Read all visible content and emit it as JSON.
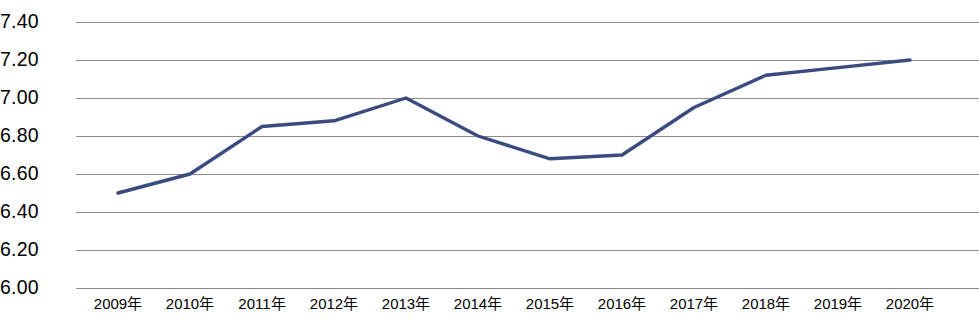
{
  "chart_data": {
    "type": "line",
    "title": "",
    "subtitle": "",
    "xlabel": "",
    "ylabel": "",
    "categories": [
      "2009年",
      "2010年",
      "2011年",
      "2012年",
      "2013年",
      "2014年",
      "2015年",
      "2016年",
      "2017年",
      "2018年",
      "2019年",
      "2020年"
    ],
    "series": [
      {
        "name": "",
        "values": [
          6.5,
          6.6,
          6.85,
          6.88,
          7.0,
          6.8,
          6.68,
          6.7,
          6.95,
          7.12,
          7.16,
          7.2
        ]
      }
    ],
    "ylim": [
      6.0,
      7.4
    ],
    "ytick_labels": [
      "7.40",
      "7.20",
      "7.00",
      "6.80",
      "6.60",
      "6.40",
      "6.20",
      "6.00"
    ],
    "ytick_values": [
      7.4,
      7.2,
      7.0,
      6.8,
      6.6,
      6.4,
      6.2,
      6.0
    ],
    "grid": true,
    "grid_axis": "y",
    "legend": false,
    "legend_position": "none",
    "annotations": [],
    "colors": {
      "line": "#3b4a7f",
      "gridline": "#8d8d8d",
      "text": "#000000",
      "background": "#ffffff"
    },
    "line_width": 3.4,
    "markers": false
  }
}
